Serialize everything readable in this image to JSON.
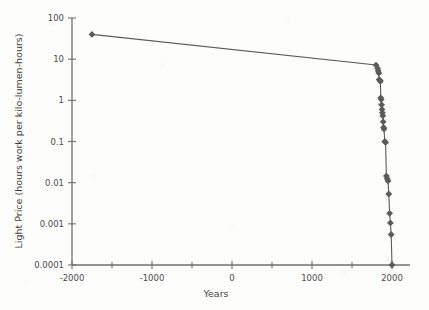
{
  "chart_data": {
    "type": "line",
    "title": "",
    "xlabel": "Years",
    "ylabel": "Light Price (hours work per kilo-lumen-hours)",
    "yscale": "log",
    "xscale": "linear",
    "xlim": [
      -2000,
      2100
    ],
    "ylim": [
      0.0001,
      100
    ],
    "grid": false,
    "legend": "none",
    "xticks": [
      -2000,
      -1000,
      0,
      1000,
      2000
    ],
    "xtick_labels": [
      "-2000",
      "-1000",
      "0",
      "1000",
      "2000"
    ],
    "xminorticks": [
      -1500,
      -500,
      500,
      1500
    ],
    "yticks": [
      100,
      10,
      1,
      0.1,
      0.01,
      0.001,
      0.0001
    ],
    "ytick_labels": [
      "100",
      "10",
      "1",
      "0.1",
      "0.01",
      "0.001",
      "0.0001"
    ],
    "series": [
      {
        "name": "Light Price",
        "marker": "diamond",
        "color": "#5b5b5b",
        "x": [
          -1750,
          1800,
          1820,
          1827,
          1835,
          1840,
          1850,
          1855,
          1860,
          1865,
          1870,
          1875,
          1880,
          1885,
          1890,
          1895,
          1900,
          1910,
          1920,
          1930,
          1940,
          1950,
          1960,
          1970,
          1980,
          1990,
          2000
        ],
        "y": [
          40,
          7.2,
          6.0,
          5.2,
          4.6,
          3.2,
          3.0,
          2.9,
          1.15,
          1.05,
          0.78,
          0.6,
          0.5,
          0.42,
          0.3,
          0.22,
          0.2,
          0.1,
          0.095,
          0.0145,
          0.0125,
          0.011,
          0.0053,
          0.0018,
          0.00105,
          0.00055,
          0.0001
        ]
      }
    ]
  },
  "axis_titles": {
    "x": "Years",
    "y": "Light Price (hours work per kilo-lumen-hours)"
  }
}
